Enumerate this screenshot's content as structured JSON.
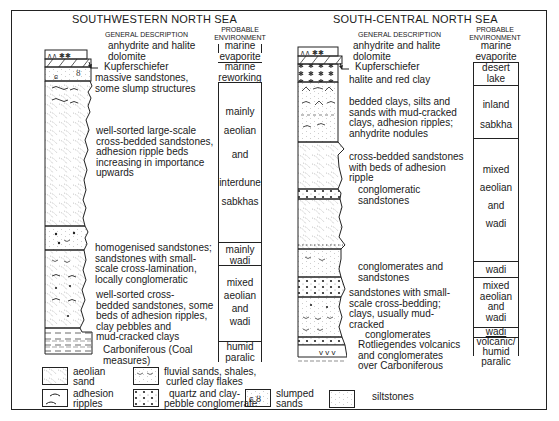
{
  "left_section": {
    "title": "SOUTHWESTERN NORTH SEA",
    "desc_header": "GENERAL DESCRIPTION",
    "env_header_1": "PROBABLE",
    "env_header_2": "ENVIRONMENT",
    "descriptions": [
      "anhydrite and halite",
      "dolomite",
      "Kupferschiefer",
      "massive sandstones,",
      "some slump structures",
      "well-sorted large-scale",
      "cross-bedded sandstones,",
      "adhesion ripple beds",
      "increasing in importance",
      "upwards",
      "homogenised sandstones;",
      "sandstones with small-",
      "scale cross-lamination,",
      "locally conglomeratic",
      "well-sorted cross-",
      "bedded sandstones, some",
      "beds of adhesion ripples,",
      "clay pebbles and",
      "mud-cracked clays",
      "Carboniferous (Coal",
      "measures)"
    ],
    "environments": {
      "e1a": "marine",
      "e1b": "evaporite",
      "e2a": "marine",
      "e2b": "reworking",
      "e3a": "mainly",
      "e3b": "aeolian",
      "e3c": "and",
      "e3d": "interdune",
      "e3e": "sabkhas",
      "e4a": "mainly",
      "e4b": "wadi",
      "e5a": "mixed",
      "e5b": "aeolian",
      "e5c": "and",
      "e5d": "wadi",
      "e6a": "humid",
      "e6b": "paralic"
    }
  },
  "right_section": {
    "title": "SOUTH-CENTRAL NORTH SEA",
    "desc_header": "GENERAL DESCRIPTION",
    "env_header_1": "PROBABLE",
    "env_header_2": "ENVIRONMENT",
    "descriptions": [
      "anhydrite and halite",
      "dolomite",
      "Kupferschiefer",
      "halite and red clay",
      "bedded clays, silts and",
      "sands with mud-cracked",
      "clays, adhesion ripples;",
      "anhydrite nodules",
      "cross-bedded sandstones",
      "with beds of adhesion",
      "ripple",
      "conglomeratic",
      "sandstones",
      "conglomerates  and",
      "sandstones",
      "sandstones with small-",
      "scale cross-bedding;",
      "clays, usually mud-",
      "cracked",
      "conglomerates",
      "Rotliegendes volcanics",
      "and conglomerates",
      "over Carboniferous"
    ],
    "environments": {
      "e1a": "marine",
      "e1b": "evaporite",
      "e2a": "desert",
      "e2b": "lake",
      "e3a": "inland",
      "e3b": "sabkha",
      "e4a": "mixed",
      "e4b": "aeolian",
      "e4c": "and",
      "e4d": "wadi",
      "e5a": "wadi",
      "e6a": "mixed",
      "e6b": "aeolian",
      "e6c": "and",
      "e6d": "wadi",
      "e7a": "wadi",
      "e8a": "volcanic/",
      "e8b": "humid",
      "e8c": "paralic"
    }
  },
  "legend": {
    "items": [
      {
        "line1": "aeolian",
        "line2": "sand",
        "icon": "aeolian-sand-pattern"
      },
      {
        "line1": "adhesion",
        "line2": "ripples",
        "icon": "adhesion-ripples-pattern"
      },
      {
        "line1": "fluvial sands, shales,",
        "line2": "curled clay flakes",
        "icon": "fluvial-sands-pattern"
      },
      {
        "line1": "quartz and clay-",
        "line2": "pebble conglomerate",
        "icon": "conglomerate-pattern"
      },
      {
        "line1": "slumped",
        "line2": "sands",
        "icon": "slumped-sands-pattern"
      },
      {
        "line1": "siltstones",
        "line2": "",
        "icon": "siltstones-pattern"
      }
    ]
  },
  "colors": {
    "ink": "#1a1a1a",
    "paper": "#ffffff",
    "pattern": "#9a9a9a"
  }
}
